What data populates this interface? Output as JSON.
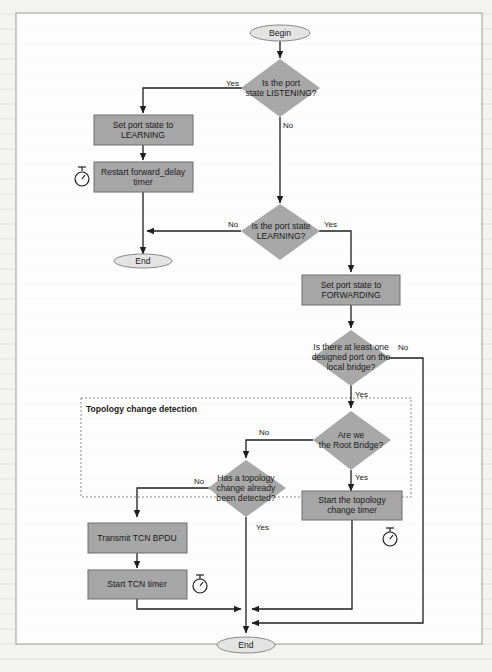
{
  "diagram": {
    "nodes": {
      "begin": {
        "label": "Begin",
        "type": "terminator"
      },
      "q_listening": {
        "line1": "Is the port",
        "line2": "state LISTENING?",
        "type": "decision"
      },
      "set_learning": {
        "line1": "Set port state to",
        "line2": "LEARNING",
        "type": "process"
      },
      "restart_fd_timer": {
        "line1": "Restart forward_delay",
        "line2": "timer",
        "type": "process"
      },
      "q_learning": {
        "line1": "Is the port state",
        "line2": "LEARNING?",
        "type": "decision"
      },
      "end_top": {
        "label": "End",
        "type": "terminator"
      },
      "set_forwarding": {
        "line1": "Set port state to",
        "line2": "FORWARDING",
        "type": "process"
      },
      "q_designated": {
        "line1": "Is there at least one",
        "line2": "designed port on the",
        "line3": "local bridge?",
        "type": "decision"
      },
      "q_root": {
        "line1": "Are we",
        "line2": "the Root Bridge?",
        "type": "decision"
      },
      "q_tc_detected": {
        "line1": "Has a topology",
        "line2": "change already",
        "line3": "been detected?",
        "type": "decision"
      },
      "start_tc_timer": {
        "line1": "Start the topology",
        "line2": "change timer",
        "type": "process"
      },
      "transmit_tcn": {
        "label": "Transmit TCN BPDU",
        "type": "process"
      },
      "start_tcn_timer": {
        "label": "Start TCN timer",
        "type": "process"
      },
      "end_bottom": {
        "label": "End",
        "type": "terminator"
      }
    },
    "edges": {
      "listening_yes": "Yes",
      "listening_no": "No",
      "learning_no": "No",
      "learning_yes": "Yes",
      "designated_no": "No",
      "designated_yes": "Yes",
      "root_no": "No",
      "root_yes": "Yes",
      "tc_no": "No",
      "tc_yes": "Yes"
    },
    "group": {
      "title": "Topology change detection"
    },
    "icons": {
      "timer_1": "stopwatch-icon",
      "timer_2": "stopwatch-icon",
      "timer_3": "stopwatch-icon"
    }
  }
}
